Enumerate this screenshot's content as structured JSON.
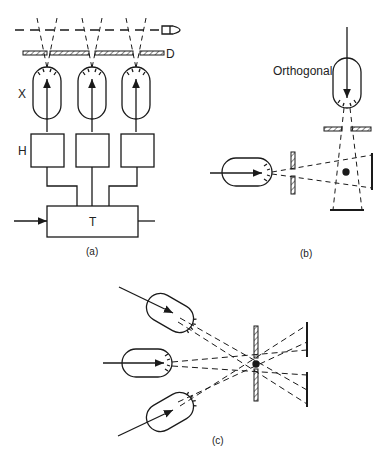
{
  "figure": {
    "panels": [
      {
        "id": "a",
        "caption": "(a)",
        "labels": {
          "beam": "",
          "diaphragm": "D",
          "tubes": "X",
          "boxes": "H",
          "transformer": "T"
        }
      },
      {
        "id": "b",
        "caption": "(b)",
        "labels": {
          "orthogonal": "Orthogonal"
        }
      },
      {
        "id": "c",
        "caption": "(c)"
      }
    ],
    "colors": {
      "line": "#1a1a1a",
      "background": "#ffffff"
    }
  }
}
